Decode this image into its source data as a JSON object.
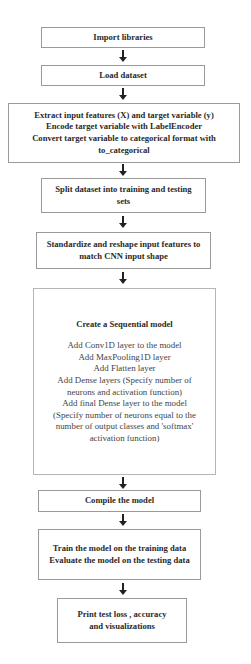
{
  "flowchart": {
    "steps": [
      {
        "id": "import",
        "lines": [
          "Import libraries"
        ]
      },
      {
        "id": "load",
        "lines": [
          "Load dataset"
        ]
      },
      {
        "id": "extract",
        "lines": [
          "Extract input features (X) and target variable (y)",
          "Encode target variable with LabelEncoder",
          "Convert target variable to categorical format with",
          "to_categorical"
        ]
      },
      {
        "id": "split",
        "lines": [
          "Split dataset into training and testing",
          "sets"
        ]
      },
      {
        "id": "standardize",
        "lines": [
          "Standardize and reshape input features to",
          "match CNN input shape"
        ]
      },
      {
        "id": "model",
        "title": "Create a Sequential model",
        "lines": [
          "Add Conv1D layer to the model",
          "Add MaxPooling1D layer",
          "Add Flatten layer",
          "Add Dense layers (Specify number of",
          "neurons and activation function)",
          "Add final Dense layer to the model",
          "(Specify number of neurons equal to the",
          "number of output classes and 'softmax'",
          "activation function)"
        ]
      },
      {
        "id": "compile",
        "lines": [
          "Compile the model"
        ]
      },
      {
        "id": "train",
        "lines": [
          "Train the model on the training data",
          "Evaluate the model on the testing data"
        ]
      },
      {
        "id": "print",
        "lines": [
          "Print test loss , accuracy",
          "and visualizations"
        ]
      }
    ],
    "arrow_icon": "down-arrow-icon",
    "colors": {
      "border": "#9a9a9a",
      "text": "#2a2a2a",
      "arrow": "#222222"
    }
  }
}
